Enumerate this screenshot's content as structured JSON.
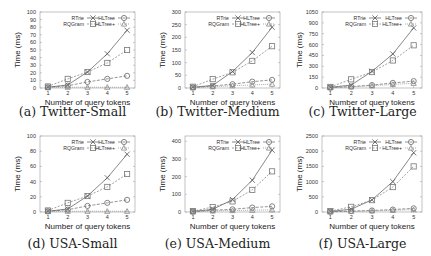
{
  "figure": {
    "legend_labels": [
      "RTrie",
      "RQGram",
      "HLTree",
      "HLTree+"
    ],
    "xlabel": "Number of query tokens",
    "ylabel": "Time (ms)"
  },
  "chart_data": [
    {
      "id": "a",
      "type": "line",
      "title": "(a) Twitter-Small",
      "xlabel": "Number of query tokens",
      "ylabel": "Time (ms)",
      "x": [
        1,
        2,
        3,
        4,
        5
      ],
      "ylim": [
        0,
        100
      ],
      "yticks": [
        0,
        10,
        20,
        30,
        40,
        50,
        60,
        70,
        80,
        90,
        100
      ],
      "grid": false,
      "legend_position": "top (2 columns, inside)",
      "series": [
        {
          "name": "RTrie",
          "marker": "x",
          "values": [
            1,
            4,
            21,
            45,
            76
          ]
        },
        {
          "name": "RQGram",
          "marker": "square",
          "values": [
            2,
            12,
            21,
            33,
            50
          ]
        },
        {
          "name": "HLTree",
          "marker": "circle",
          "values": [
            1,
            3,
            8,
            12,
            16
          ]
        },
        {
          "name": "HLTree+",
          "marker": "triangle",
          "values": [
            0.5,
            1,
            1,
            1,
            1
          ]
        }
      ]
    },
    {
      "id": "b",
      "type": "line",
      "title": "(b) Twitter-Medium",
      "xlabel": "Number of query tokens",
      "ylabel": "Time (ms)",
      "x": [
        1,
        2,
        3,
        4,
        5
      ],
      "ylim": [
        0,
        300
      ],
      "yticks": [
        0,
        50,
        100,
        150,
        200,
        250,
        300
      ],
      "grid": false,
      "legend_position": "top (2 columns, inside)",
      "series": [
        {
          "name": "RTrie",
          "marker": "x",
          "values": [
            3,
            10,
            65,
            140,
            240
          ]
        },
        {
          "name": "RQGram",
          "marker": "square",
          "values": [
            5,
            35,
            62,
            107,
            165
          ]
        },
        {
          "name": "HLTree",
          "marker": "circle",
          "values": [
            2,
            8,
            15,
            25,
            32
          ]
        },
        {
          "name": "HLTree+",
          "marker": "triangle",
          "values": [
            1,
            5,
            9,
            12,
            15
          ]
        }
      ]
    },
    {
      "id": "c",
      "type": "line",
      "title": "(c) Twitter-Large",
      "xlabel": "Number of query tokens",
      "ylabel": "Time (ms)",
      "x": [
        1,
        2,
        3,
        4,
        5
      ],
      "ylim": [
        0,
        1050
      ],
      "yticks": [
        0,
        150,
        300,
        450,
        600,
        750,
        900,
        1050
      ],
      "grid": false,
      "legend_position": "top (2 columns, inside)",
      "series": [
        {
          "name": "RTrie",
          "marker": "x",
          "values": [
            10,
            40,
            230,
            470,
            830
          ]
        },
        {
          "name": "RQGram",
          "marker": "square",
          "values": [
            15,
            120,
            220,
            380,
            590
          ]
        },
        {
          "name": "HLTree",
          "marker": "circle",
          "values": [
            5,
            20,
            40,
            70,
            95
          ]
        },
        {
          "name": "HLTree+",
          "marker": "triangle",
          "values": [
            3,
            15,
            30,
            50,
            65
          ]
        }
      ]
    },
    {
      "id": "d",
      "type": "line",
      "title": "(d) USA-Small",
      "xlabel": "Number of query tokens",
      "ylabel": "Time (ms)",
      "x": [
        1,
        2,
        3,
        4,
        5
      ],
      "ylim": [
        0,
        100
      ],
      "yticks": [
        0,
        20,
        40,
        60,
        80,
        100
      ],
      "grid": false,
      "legend_position": "top (2 columns, inside)",
      "series": [
        {
          "name": "RTrie",
          "marker": "x",
          "values": [
            1,
            4,
            21,
            45,
            76
          ]
        },
        {
          "name": "RQGram",
          "marker": "square",
          "values": [
            2,
            12,
            21,
            33,
            50
          ]
        },
        {
          "name": "HLTree",
          "marker": "circle",
          "values": [
            1,
            3,
            8,
            12,
            16
          ]
        },
        {
          "name": "HLTree+",
          "marker": "triangle",
          "values": [
            0.5,
            1,
            1,
            1,
            1
          ]
        }
      ]
    },
    {
      "id": "e",
      "type": "line",
      "title": "(e) USA-Medium",
      "xlabel": "Number of query tokens",
      "ylabel": "Time (ms)",
      "x": [
        1,
        2,
        3,
        4,
        5
      ],
      "ylim": [
        0,
        430
      ],
      "yticks": [
        0,
        100,
        200,
        300,
        400
      ],
      "grid": false,
      "legend_position": "top (2 columns, inside)",
      "series": [
        {
          "name": "RTrie",
          "marker": "x",
          "values": [
            3,
            15,
            70,
            180,
            350
          ]
        },
        {
          "name": "RQGram",
          "marker": "square",
          "values": [
            5,
            28,
            60,
            125,
            230
          ]
        },
        {
          "name": "HLTree",
          "marker": "circle",
          "values": [
            2,
            10,
            15,
            25,
            32
          ]
        },
        {
          "name": "HLTree+",
          "marker": "triangle",
          "values": [
            1,
            6,
            8,
            10,
            12
          ]
        }
      ]
    },
    {
      "id": "f",
      "type": "line",
      "title": "(f) USA-Large",
      "xlabel": "Number of query tokens",
      "ylabel": "Time (ms)",
      "x": [
        1,
        2,
        3,
        4,
        5
      ],
      "ylim": [
        0,
        2500
      ],
      "yticks": [
        0,
        500,
        1000,
        1500,
        2000,
        2500
      ],
      "grid": false,
      "legend_position": "top (2 columns, inside)",
      "series": [
        {
          "name": "RTrie",
          "marker": "x",
          "values": [
            20,
            90,
            400,
            1000,
            1950
          ]
        },
        {
          "name": "RQGram",
          "marker": "square",
          "values": [
            30,
            170,
            390,
            820,
            1500
          ]
        },
        {
          "name": "HLTree",
          "marker": "circle",
          "values": [
            10,
            30,
            50,
            80,
            120
          ]
        },
        {
          "name": "HLTree+",
          "marker": "triangle",
          "values": [
            5,
            20,
            35,
            55,
            75
          ]
        }
      ]
    }
  ]
}
